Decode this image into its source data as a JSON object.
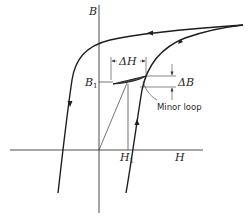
{
  "figure": {
    "type": "magnetic hysteresis diagram (B-H curve) with minor loop",
    "axes": {
      "vertical_label": "B",
      "horizontal_label": "H"
    },
    "labels": {
      "b1": "B",
      "b1_sub": "1",
      "h1": "H",
      "h1_sub": "1",
      "delta_h": "ΔH",
      "delta_b": "ΔB",
      "minor_loop": "Minor loop"
    },
    "colors": {
      "line": "#1e1e1e",
      "thin_line": "#3a3a3a",
      "background": "#ffffff"
    }
  }
}
